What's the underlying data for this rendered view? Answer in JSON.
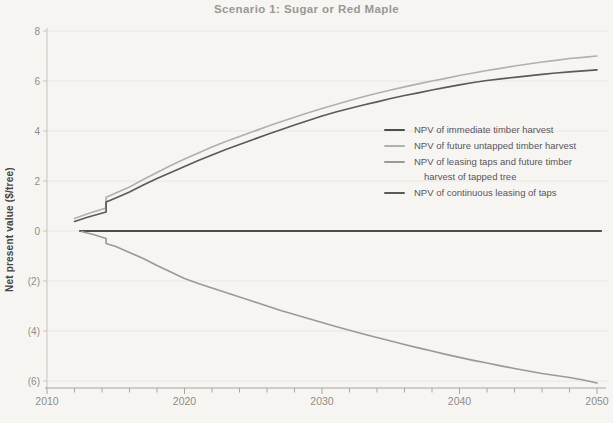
{
  "chart_data": {
    "type": "line",
    "title": "Scenario 1: Sugar or Red Maple",
    "xlabel": "",
    "ylabel": "Net present value ($/tree)",
    "xlim": [
      2010,
      2050
    ],
    "ylim": [
      -6,
      8
    ],
    "grid": "horizontal",
    "legend_position": "middle-right",
    "x_ticks": [
      {
        "value": 2010,
        "label": "2010"
      },
      {
        "value": 2020,
        "label": "2020"
      },
      {
        "value": 2030,
        "label": "2030"
      },
      {
        "value": 2040,
        "label": "2040"
      },
      {
        "value": 2050,
        "label": "2050"
      }
    ],
    "x_minor_tick_step": 2,
    "y_ticks": [
      {
        "value": 8,
        "label": "8"
      },
      {
        "value": 6,
        "label": "6"
      },
      {
        "value": 4,
        "label": "4"
      },
      {
        "value": 2,
        "label": "2"
      },
      {
        "value": 0,
        "label": "0"
      },
      {
        "value": -2,
        "label": "(2)"
      },
      {
        "value": -4,
        "label": "(4)"
      },
      {
        "value": -6,
        "label": "(6)"
      }
    ],
    "series": [
      {
        "name": "NPV of immediate timber harvest",
        "color": "#4e4d4a",
        "width": 2,
        "points": [
          [
            2012.4,
            0
          ],
          [
            2050.3,
            0
          ]
        ]
      },
      {
        "name": "NPV of future untapped timber harvest",
        "color": "#b1b0ad",
        "width": 1.7,
        "points": [
          [
            2012,
            0.5
          ],
          [
            2013,
            0.7
          ],
          [
            2014.3,
            0.92
          ],
          [
            2014.3,
            1.35
          ],
          [
            2015,
            1.52
          ],
          [
            2016,
            1.76
          ],
          [
            2017,
            2.06
          ],
          [
            2018,
            2.34
          ],
          [
            2019,
            2.62
          ],
          [
            2020,
            2.88
          ],
          [
            2021,
            3.12
          ],
          [
            2022,
            3.36
          ],
          [
            2023,
            3.58
          ],
          [
            2024,
            3.78
          ],
          [
            2025,
            3.98
          ],
          [
            2026,
            4.18
          ],
          [
            2027,
            4.37
          ],
          [
            2028,
            4.55
          ],
          [
            2029,
            4.73
          ],
          [
            2030,
            4.9
          ],
          [
            2031,
            5.06
          ],
          [
            2032,
            5.22
          ],
          [
            2033,
            5.37
          ],
          [
            2034,
            5.51
          ],
          [
            2035,
            5.64
          ],
          [
            2036,
            5.77
          ],
          [
            2037,
            5.89
          ],
          [
            2038,
            6.0
          ],
          [
            2039,
            6.11
          ],
          [
            2040,
            6.22
          ],
          [
            2041,
            6.32
          ],
          [
            2042,
            6.42
          ],
          [
            2043,
            6.51
          ],
          [
            2044,
            6.6
          ],
          [
            2045,
            6.68
          ],
          [
            2046,
            6.76
          ],
          [
            2047,
            6.83
          ],
          [
            2048,
            6.9
          ],
          [
            2049,
            6.95
          ],
          [
            2050,
            7.0
          ]
        ]
      },
      {
        "name": "NPV of leasing taps and future timber harvest of tapped tree",
        "legend_lines": [
          "NPV of leasing taps and future timber",
          "harvest of tapped tree"
        ],
        "color": "#9b9a96",
        "width": 1.7,
        "points": [
          [
            2012.5,
            -0.02
          ],
          [
            2013.5,
            -0.16
          ],
          [
            2014.3,
            -0.3
          ],
          [
            2014.3,
            -0.5
          ],
          [
            2015,
            -0.62
          ],
          [
            2016,
            -0.86
          ],
          [
            2017,
            -1.1
          ],
          [
            2018,
            -1.38
          ],
          [
            2019,
            -1.64
          ],
          [
            2020,
            -1.9
          ],
          [
            2021,
            -2.1
          ],
          [
            2022,
            -2.28
          ],
          [
            2023,
            -2.46
          ],
          [
            2024,
            -2.64
          ],
          [
            2025,
            -2.82
          ],
          [
            2026,
            -3.0
          ],
          [
            2027,
            -3.18
          ],
          [
            2028,
            -3.34
          ],
          [
            2029,
            -3.5
          ],
          [
            2030,
            -3.66
          ],
          [
            2031,
            -3.82
          ],
          [
            2032,
            -3.97
          ],
          [
            2033,
            -4.12
          ],
          [
            2034,
            -4.26
          ],
          [
            2035,
            -4.4
          ],
          [
            2036,
            -4.54
          ],
          [
            2037,
            -4.67
          ],
          [
            2038,
            -4.8
          ],
          [
            2039,
            -4.93
          ],
          [
            2040,
            -5.05
          ],
          [
            2041,
            -5.17
          ],
          [
            2042,
            -5.28
          ],
          [
            2043,
            -5.39
          ],
          [
            2044,
            -5.5
          ],
          [
            2045,
            -5.6
          ],
          [
            2046,
            -5.7
          ],
          [
            2047,
            -5.78
          ],
          [
            2048,
            -5.86
          ],
          [
            2049,
            -5.96
          ],
          [
            2050,
            -6.08
          ]
        ]
      },
      {
        "name": "NPV of continuous leasing of taps",
        "color": "#5b5a57",
        "width": 1.7,
        "points": [
          [
            2012,
            0.38
          ],
          [
            2013,
            0.56
          ],
          [
            2014.3,
            0.76
          ],
          [
            2014.3,
            1.16
          ],
          [
            2015,
            1.32
          ],
          [
            2016,
            1.56
          ],
          [
            2017,
            1.84
          ],
          [
            2018,
            2.1
          ],
          [
            2019,
            2.34
          ],
          [
            2020,
            2.58
          ],
          [
            2021,
            2.82
          ],
          [
            2022,
            3.04
          ],
          [
            2023,
            3.26
          ],
          [
            2024,
            3.46
          ],
          [
            2025,
            3.66
          ],
          [
            2026,
            3.86
          ],
          [
            2027,
            4.05
          ],
          [
            2028,
            4.24
          ],
          [
            2029,
            4.42
          ],
          [
            2030,
            4.6
          ],
          [
            2031,
            4.76
          ],
          [
            2032,
            4.9
          ],
          [
            2033,
            5.04
          ],
          [
            2034,
            5.17
          ],
          [
            2035,
            5.3
          ],
          [
            2036,
            5.42
          ],
          [
            2037,
            5.53
          ],
          [
            2038,
            5.64
          ],
          [
            2039,
            5.75
          ],
          [
            2040,
            5.85
          ],
          [
            2041,
            5.94
          ],
          [
            2042,
            6.02
          ],
          [
            2043,
            6.09
          ],
          [
            2044,
            6.15
          ],
          [
            2045,
            6.21
          ],
          [
            2046,
            6.27
          ],
          [
            2047,
            6.32
          ],
          [
            2048,
            6.37
          ],
          [
            2049,
            6.41
          ],
          [
            2050,
            6.45
          ]
        ]
      }
    ],
    "style_colors": {
      "background": "#f7f5f2",
      "gridline": "#eae8e3",
      "y_axis_line": "#c6c4bf",
      "x_axis_line": "#a8a6a1",
      "tick_label": "#8f8d89",
      "title": "#9a9893",
      "legend_text": "#58565c"
    }
  }
}
